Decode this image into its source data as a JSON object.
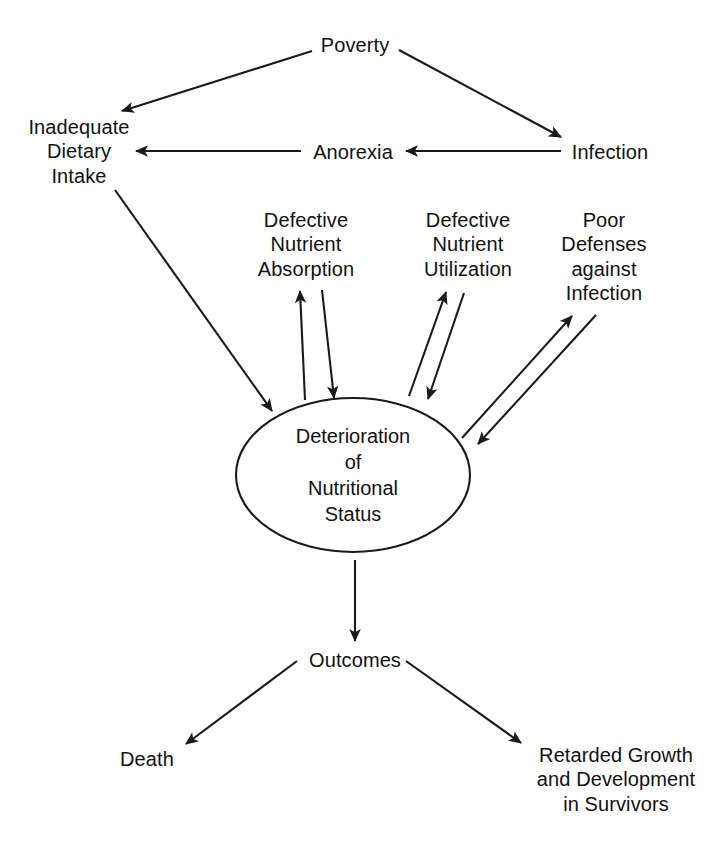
{
  "diagram": {
    "background_color": "#ffffff",
    "line_color": "#1a1a1a",
    "text_color": "#111111",
    "nodes": {
      "poverty": {
        "text": "Poverty"
      },
      "inadequate_dietary_intake": {
        "text": "Inadequate\nDietary\nIntake"
      },
      "anorexia": {
        "text": "Anorexia"
      },
      "infection": {
        "text": "Infection"
      },
      "defective_nutrient_absorption": {
        "text": "Defective\nNutrient\nAbsorption"
      },
      "defective_nutrient_utilization": {
        "text": "Defective\nNutrient\nUtilization"
      },
      "poor_defenses_against_infection": {
        "text": "Poor\nDefenses\nagainst\nInfection"
      },
      "deterioration_of_nutritional_status": {
        "text": "Deterioration\nof\nNutritional\nStatus"
      },
      "outcomes": {
        "text": "Outcomes"
      },
      "death": {
        "text": "Death"
      },
      "retarded_growth": {
        "text": "Retarded Growth\nand Development\nin Survivors"
      }
    },
    "edges": [
      {
        "name": "poverty-to-inadequate-dietary-intake",
        "from": "poverty",
        "to": "inadequate_dietary_intake",
        "style": "single-arrow"
      },
      {
        "name": "poverty-to-infection",
        "from": "poverty",
        "to": "infection",
        "style": "single-arrow"
      },
      {
        "name": "infection-to-anorexia",
        "from": "infection",
        "to": "anorexia",
        "style": "single-arrow"
      },
      {
        "name": "anorexia-to-inadequate-dietary-intake",
        "from": "anorexia",
        "to": "inadequate_dietary_intake",
        "style": "single-arrow"
      },
      {
        "name": "inadequate-dietary-intake-to-deterioration",
        "from": "inadequate_dietary_intake",
        "to": "deterioration_of_nutritional_status",
        "style": "single-arrow"
      },
      {
        "name": "deterioration-absorption-pair",
        "from": "deterioration_of_nutritional_status",
        "to": "defective_nutrient_absorption",
        "style": "double-arrow-pair"
      },
      {
        "name": "deterioration-utilization-pair",
        "from": "deterioration_of_nutritional_status",
        "to": "defective_nutrient_utilization",
        "style": "double-arrow-pair"
      },
      {
        "name": "deterioration-poor-defenses-pair",
        "from": "deterioration_of_nutritional_status",
        "to": "poor_defenses_against_infection",
        "style": "double-arrow-pair"
      },
      {
        "name": "deterioration-to-outcomes",
        "from": "deterioration_of_nutritional_status",
        "to": "outcomes",
        "style": "single-arrow"
      },
      {
        "name": "outcomes-to-death",
        "from": "outcomes",
        "to": "death",
        "style": "single-arrow"
      },
      {
        "name": "outcomes-to-retarded-growth",
        "from": "outcomes",
        "to": "retarded_growth",
        "style": "single-arrow"
      }
    ]
  }
}
